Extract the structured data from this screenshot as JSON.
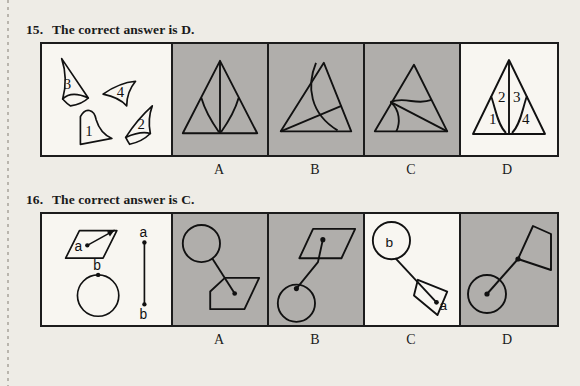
{
  "page": {
    "background_color": "#eeece6",
    "ink_color": "#1a1a1a",
    "panel_white": "#f8f6f1",
    "panel_gray": "#b0aeab"
  },
  "questions": [
    {
      "id": "q15",
      "number": "15.",
      "heading": "The correct answer is D.",
      "answer": "D",
      "stem": {
        "kind": "loose-pieces",
        "piece_labels": [
          "3",
          "4",
          "1",
          "2"
        ],
        "description": "Four curved triangular pieces labelled 3, 4, 1 and 2 scattered in the panel."
      },
      "options": [
        {
          "label": "A",
          "shaded": true,
          "description": "Tall triangle with a vertical line from apex to base and two concave arcs meeting it."
        },
        {
          "label": "B",
          "shaded": true,
          "description": "Triangle crossed by one straight chord and one large curve bowing through it."
        },
        {
          "label": "C",
          "shaded": true,
          "description": "Wide triangle with an S-curve and a straight line running to the bottom-right corner."
        },
        {
          "label": "D",
          "shaded": false,
          "description": "Triangle partitioned into four regions numbered 1, 2, 3, 4 by a vertical spike and two arcs.",
          "region_labels": [
            "1",
            "2",
            "3",
            "4"
          ]
        }
      ],
      "option_labels": [
        "A",
        "B",
        "C",
        "D"
      ]
    },
    {
      "id": "q16",
      "number": "16.",
      "heading": "The correct answer is C.",
      "answer": "C",
      "stem": {
        "kind": "objects-and-segment",
        "shape_labels": [
          "a",
          "b"
        ],
        "segment_labels": [
          "a",
          "b"
        ],
        "description": "A parallelogram with interior point a, a circle with point b on its top, and a vertical segment whose endpoints are labelled a (top) and b (bottom)."
      },
      "options": [
        {
          "label": "A",
          "shaded": true,
          "description": "Circle upper-left joined by a segment to a dot inside a parallelogram at lower-right."
        },
        {
          "label": "B",
          "shaded": true,
          "description": "Parallelogram upper-right with an interior dot joined by a bent segment down to a circle at lower-left."
        },
        {
          "label": "C",
          "shaded": false,
          "description": "Circle upper-left labelled b joined by a segment to point a inside a tilted parallelogram at lower-right.",
          "shape_labels": [
            "b",
            "a"
          ]
        },
        {
          "label": "D",
          "shaded": true,
          "description": "Circle lower-left with a centre dot joined by a segment to the left vertex of a parallelogram at upper-right."
        }
      ],
      "option_labels": [
        "A",
        "B",
        "C",
        "D"
      ]
    }
  ]
}
